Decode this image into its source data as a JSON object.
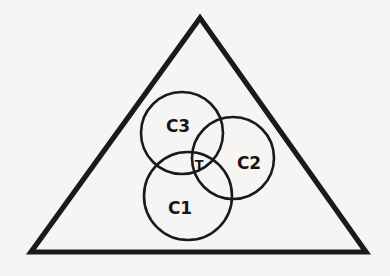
{
  "figure": {
    "name": "nested-set-venn-in-triangle",
    "background_color": "#f6f5f3",
    "stroke_color": "#1a1a1a",
    "label_color": "#161616",
    "width": 390,
    "height": 276,
    "triangle": {
      "name": "outer-triangle",
      "stroke_width": 5.2,
      "points": "200,18 366,252 31,252",
      "apex_x": 200,
      "apex_y": 18,
      "bottom_left_x": 31,
      "bottom_left_y": 252,
      "bottom_right_x": 366,
      "bottom_right_y": 252
    },
    "circles": [
      {
        "id": "c3",
        "label": "C3",
        "cx": 182,
        "cy": 133,
        "r": 41,
        "label_x": 178,
        "label_y": 126,
        "label_class": "label-c3",
        "stroke_width": 2.6
      },
      {
        "id": "c2",
        "label": "C2",
        "cx": 233,
        "cy": 158,
        "r": 41,
        "label_x": 249,
        "label_y": 163,
        "label_class": "label-c2",
        "stroke_width": 2.6
      },
      {
        "id": "c1",
        "label": "C1",
        "cx": 188,
        "cy": 196,
        "r": 44,
        "label_x": 180,
        "label_y": 208,
        "label_class": "label-c1",
        "stroke_width": 2.6
      }
    ],
    "intersection": {
      "id": "t",
      "label": "T",
      "label_x": 199,
      "label_y": 164,
      "label_class": "label-t"
    }
  }
}
